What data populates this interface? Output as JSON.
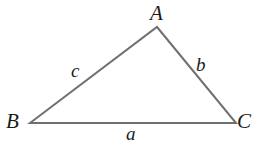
{
  "figure": {
    "type": "geometry-diagram",
    "shape": "triangle",
    "background_color": "#ffffff",
    "stroke_color": "#707070",
    "stroke_width": 2,
    "label_color": "#1a1a1a",
    "canvas": {
      "width": 270,
      "height": 145
    }
  },
  "vertices": [
    {
      "id": "A",
      "label": "A",
      "x": 157,
      "y": 27
    },
    {
      "id": "B",
      "label": "B",
      "x": 30,
      "y": 123
    },
    {
      "id": "C",
      "label": "C",
      "x": 236,
      "y": 123
    }
  ],
  "sides": [
    {
      "id": "a",
      "label": "a",
      "from": "B",
      "to": "C",
      "opposite_vertex": "A"
    },
    {
      "id": "b",
      "label": "b",
      "from": "A",
      "to": "C",
      "opposite_vertex": "B"
    },
    {
      "id": "c",
      "label": "c",
      "from": "A",
      "to": "B",
      "opposite_vertex": "C"
    }
  ],
  "geometry": {
    "polygon_points": "30,123 157,27 236,123"
  }
}
